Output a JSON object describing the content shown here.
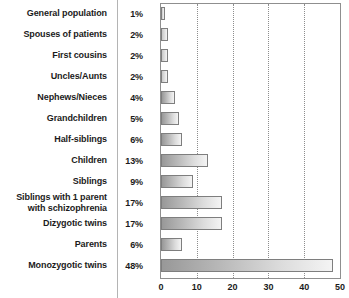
{
  "chart_data": {
    "type": "bar",
    "orientation": "horizontal",
    "title": "",
    "xlabel": "",
    "ylabel": "",
    "xlim": [
      0,
      50
    ],
    "xticks": [
      0,
      10,
      20,
      30,
      40,
      50
    ],
    "grid": "vertical-dotted",
    "legend": "none",
    "categories": [
      "General population",
      "Spouses of patients",
      "First cousins",
      "Uncles/Aunts",
      "Nephews/Nieces",
      "Grandchildren",
      "Half-siblings",
      "Children",
      "Siblings",
      "Siblings with 1 parent with schizophrenia",
      "Dizygotic twins",
      "Parents",
      "Monozygotic twins"
    ],
    "values": [
      1,
      2,
      2,
      2,
      4,
      5,
      6,
      13,
      9,
      17,
      17,
      6,
      48
    ],
    "value_labels": [
      "1%",
      "2%",
      "2%",
      "2%",
      "4%",
      "5%",
      "6%",
      "13%",
      "9%",
      "17%",
      "17%",
      "6%",
      "48%"
    ]
  },
  "rows": [
    {
      "label_line1": "General population",
      "label_line2": "",
      "pct": "1%",
      "value": 1
    },
    {
      "label_line1": "Spouses of patients",
      "label_line2": "",
      "pct": "2%",
      "value": 2
    },
    {
      "label_line1": "First cousins",
      "label_line2": "",
      "pct": "2%",
      "value": 2
    },
    {
      "label_line1": "Uncles/Aunts",
      "label_line2": "",
      "pct": "2%",
      "value": 2
    },
    {
      "label_line1": "Nephews/Nieces",
      "label_line2": "",
      "pct": "4%",
      "value": 4
    },
    {
      "label_line1": "Grandchildren",
      "label_line2": "",
      "pct": "5%",
      "value": 5
    },
    {
      "label_line1": "Half-siblings",
      "label_line2": "",
      "pct": "6%",
      "value": 6
    },
    {
      "label_line1": "Children",
      "label_line2": "",
      "pct": "13%",
      "value": 13
    },
    {
      "label_line1": "Siblings",
      "label_line2": "",
      "pct": "9%",
      "value": 9
    },
    {
      "label_line1": "Siblings with 1 parent",
      "label_line2": "with schizophrenia",
      "pct": "17%",
      "value": 17
    },
    {
      "label_line1": "Dizygotic twins",
      "label_line2": "",
      "pct": "17%",
      "value": 17
    },
    {
      "label_line1": "Parents",
      "label_line2": "",
      "pct": "6%",
      "value": 6
    },
    {
      "label_line1": "Monozygotic twins",
      "label_line2": "",
      "pct": "48%",
      "value": 48
    }
  ],
  "axis": {
    "ticks": [
      "0",
      "10",
      "20",
      "30",
      "40",
      "50"
    ]
  },
  "colors": {
    "bar_dark": "#989898",
    "bar_light": "#f4f4f4",
    "bar_border": "#7e7e7e",
    "frame": "#8f8f8f",
    "grid": "#8d8d8d",
    "text": "#1b1b1b",
    "divider": "#b4b4b4",
    "background": "#ffffff"
  }
}
